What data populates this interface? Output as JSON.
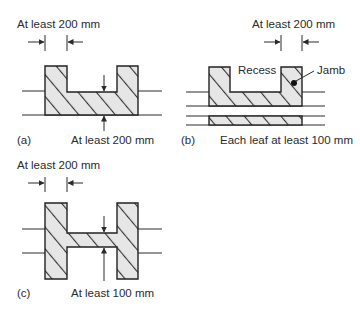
{
  "colors": {
    "stroke": "#2a2a2a",
    "fill": "#e6e6e6",
    "hatch": "#333333",
    "background": "#ffffff"
  },
  "panels": {
    "a": {
      "tag": "(a)",
      "top_dimension": "At least 200 mm",
      "bottom_dimension": "At least 200 mm"
    },
    "b": {
      "tag": "(b)",
      "top_dimension": "At least 200 mm",
      "recess_label": "Recess",
      "jamb_label": "Jamb",
      "bottom_dimension": "Each leaf at least 100 mm"
    },
    "c": {
      "tag": "(c)",
      "top_dimension": "At least 200 mm",
      "bottom_dimension": "At least 100 mm"
    }
  }
}
